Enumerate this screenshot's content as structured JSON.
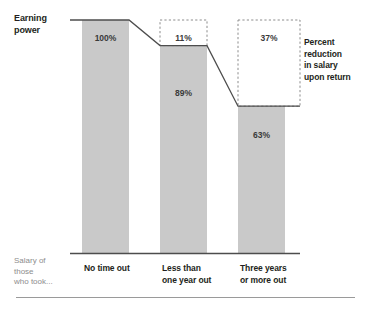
{
  "chart_data": {
    "type": "bar",
    "title": "",
    "subtitle": "",
    "xlabel": "Salary of those who took...",
    "ylabel": "Earning power",
    "ylim": [
      0,
      100
    ],
    "grid": false,
    "legend": "none",
    "categories": [
      "No time out",
      "Less than one year out",
      "Three years or more out"
    ],
    "category_lines": [
      [
        "No time out",
        ""
      ],
      [
        "Less than",
        "one year out"
      ],
      [
        "Three years",
        "or more out"
      ]
    ],
    "values": [
      100,
      89,
      63
    ],
    "value_labels": [
      "100%",
      "89%",
      "63%"
    ],
    "gap_labels": [
      "",
      "11%",
      "37%"
    ],
    "gap_values": [
      0,
      11,
      37
    ],
    "annotations": {
      "left_top": "Earning power",
      "left_bottom": "Salary of those who took...",
      "right": "Percent reduction in salary upon return"
    },
    "colors": {
      "bar_fill": "#c9c9c9",
      "bar_stroke": "#b3b3b3",
      "trend_line": "#4d4d4d",
      "dashed_box": "#8c8c8c",
      "axis_line": "#4d4d4d",
      "text_dark": "#231f20",
      "text_muted": "#8d8d8d",
      "background": "#ffffff",
      "footer_rule": "#9a9a9a"
    }
  },
  "labels": {
    "earning_power_l1": "Earning",
    "earning_power_l2": "power",
    "right_l1": "Percent",
    "right_l2": "reduction",
    "right_l3": "in salary",
    "right_l4": "upon return",
    "salary_l1": "Salary of",
    "salary_l2": "those",
    "salary_l3": "who took..."
  }
}
